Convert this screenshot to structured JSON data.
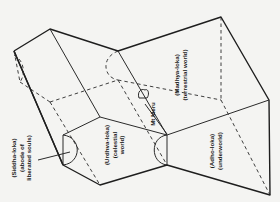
{
  "diagram": {
    "labels": {
      "siddha": [
        "(Siddha-loka)",
        "(abode of",
        "liberated souls)"
      ],
      "urdhva": [
        "(Urdhva-loka)",
        "(celestial",
        "world)"
      ],
      "meru": "Mt Meru",
      "madhya": [
        "(Madhya-loka)",
        "(terrestrial world)"
      ],
      "adho": [
        "(Adho-loka)",
        "(underworld)"
      ]
    },
    "colors": {
      "line": "#1e1e1e",
      "background": "#f4f4f2"
    }
  }
}
